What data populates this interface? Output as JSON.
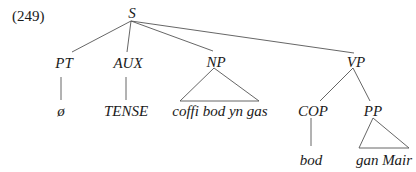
{
  "example_number": "(249)",
  "tree": {
    "root": "S",
    "nodes": {
      "S": "S",
      "PT": "PT",
      "AUX": "AUX",
      "NP": "NP",
      "VP": "VP",
      "COP": "COP",
      "PP": "PP"
    },
    "leaves": {
      "PT": "ø",
      "AUX": "TENSE",
      "NP": "coffi bod yn gas",
      "COP": "bod",
      "PP": "gan Mair"
    },
    "structure": [
      {
        "parent": "S",
        "children": [
          "PT",
          "AUX",
          "NP",
          "VP"
        ]
      },
      {
        "parent": "VP",
        "children": [
          "COP",
          "PP"
        ]
      },
      {
        "parent": "PT",
        "leaf": "ø",
        "branch": "line"
      },
      {
        "parent": "AUX",
        "leaf": "TENSE",
        "branch": "line"
      },
      {
        "parent": "NP",
        "leaf": "coffi bod yn gas",
        "branch": "triangle"
      },
      {
        "parent": "COP",
        "leaf": "bod",
        "branch": "line"
      },
      {
        "parent": "PP",
        "leaf": "gan Mair",
        "branch": "triangle"
      }
    ]
  },
  "colors": {
    "line": "#555555",
    "text": "#1a1a1a",
    "background": "#ffffff"
  }
}
